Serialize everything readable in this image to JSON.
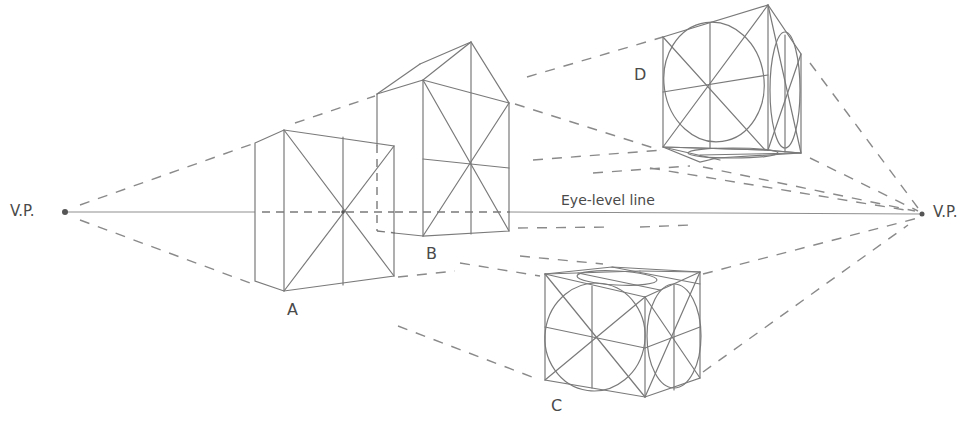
{
  "labels": {
    "vp_left": "V.P.",
    "vp_right": "V.P.",
    "eye_level": "Eye-level line",
    "object_a": "A",
    "object_b": "B",
    "object_c": "C",
    "object_d": "D"
  },
  "colors": {
    "line": "#7a7a7a",
    "guide": "#8a8a8a",
    "text": "#4a4a4a",
    "background": "#ffffff"
  },
  "diagram": {
    "type": "two-point perspective drawing",
    "vanishing_points": [
      {
        "name": "left",
        "x": 65,
        "y": 212
      },
      {
        "name": "right",
        "x": 922,
        "y": 214
      }
    ],
    "objects": [
      {
        "id": "A",
        "description": "box with diagonals, below/at eye level"
      },
      {
        "id": "B",
        "description": "house shape with gable roof"
      },
      {
        "id": "C",
        "description": "cube with inscribed ellipses, below eye level"
      },
      {
        "id": "D",
        "description": "cube with inscribed ellipses, above eye level"
      }
    ]
  }
}
